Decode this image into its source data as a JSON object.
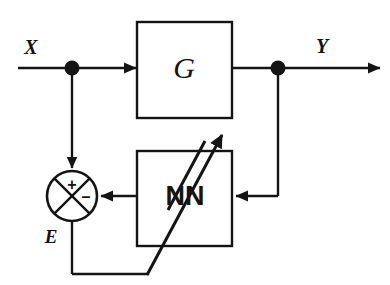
{
  "diagram": {
    "background_color": "#ffffff",
    "stroke_color": "#141414",
    "signals": {
      "input_label": "X",
      "output_label": "Y",
      "error_label": "E"
    },
    "blocks": [
      {
        "id": "plant",
        "label": "G",
        "name": "plant-block",
        "x": 137,
        "y": 22,
        "width": 95,
        "height": 96
      },
      {
        "id": "neural-net",
        "label": "NN",
        "name": "neural-network-block",
        "x": 137,
        "y": 151,
        "width": 95,
        "height": 95
      }
    ],
    "summing_junction": {
      "name": "summing-junction",
      "cx": 72,
      "cy": 196,
      "r": 25,
      "plus_sign": "+",
      "minus_sign": "–"
    },
    "nodes": [
      {
        "name": "input-branch-node",
        "cx": 72,
        "cy": 68,
        "r": 7
      },
      {
        "name": "output-branch-node",
        "cx": 278,
        "cy": 68,
        "r": 7
      }
    ],
    "adaptation_arrow": {
      "name": "adaptation-arrow",
      "description": "diagonal adaptation / training arrow through NN block"
    }
  }
}
